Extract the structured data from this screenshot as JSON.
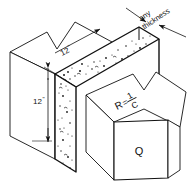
{
  "figure": {
    "kind": "engineering-isometric-diagram",
    "background_color": "#ffffff",
    "line_color": "#111111",
    "fill_color": "#ffffff",
    "speckle_color": "#1a1a1a"
  },
  "annotations": {
    "thickness_note_line1": "any",
    "thickness_note_line2": "thickness",
    "dim_top": "12",
    "dim_top_unit": "\"",
    "dim_side": "12",
    "dim_side_unit": "\"",
    "resistance_r": "R",
    "resistance_equals": "=",
    "resistance_numerator": "1",
    "resistance_denominator": "C",
    "heat_flow": "Q"
  },
  "icons": {
    "leader_arrow_upper": "arrow-head-icon",
    "leader_arrow_lower": "arrow-head-icon",
    "dim_arrow_top": "arrow-head-icon",
    "dim_arrow_side_top": "arrow-head-icon",
    "dim_arrow_side_bottom": "arrow-head-icon"
  }
}
